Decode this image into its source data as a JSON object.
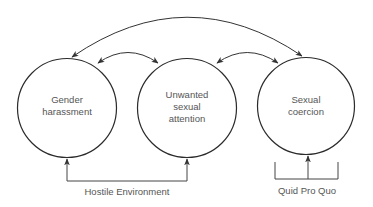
{
  "diagram": {
    "type": "relationship-diagram",
    "nodes": [
      {
        "id": "gender_harassment",
        "lines": [
          "Gender",
          "harassment"
        ]
      },
      {
        "id": "unwanted_sexual_attention",
        "lines": [
          "Unwanted",
          "sexual",
          "attention"
        ]
      },
      {
        "id": "sexual_coercion",
        "lines": [
          "Sexual",
          "coercion"
        ]
      }
    ],
    "edges": [
      {
        "from": "gender_harassment",
        "to": "unwanted_sexual_attention",
        "direction": "bidirectional"
      },
      {
        "from": "unwanted_sexual_attention",
        "to": "sexual_coercion",
        "direction": "bidirectional"
      },
      {
        "from": "gender_harassment",
        "to": "sexual_coercion",
        "direction": "bidirectional"
      }
    ],
    "groupings": [
      {
        "label": "Hostile Environment",
        "members": [
          "gender_harassment",
          "unwanted_sexual_attention"
        ]
      },
      {
        "label": "Quid Pro Quo",
        "members": [
          "sexual_coercion"
        ]
      }
    ],
    "colors": {
      "stroke": "#2b2b2b",
      "text": "#555555",
      "background": "#ffffff"
    }
  }
}
